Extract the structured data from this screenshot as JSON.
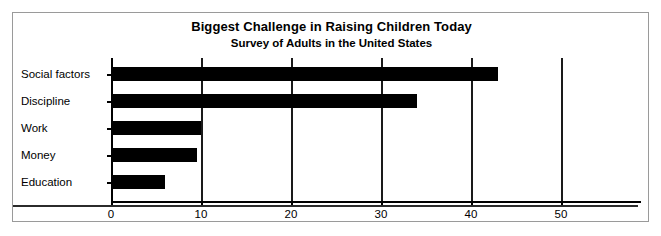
{
  "chart_data": {
    "type": "bar",
    "orientation": "horizontal",
    "title": "Biggest Challenge in Raising Children Today",
    "subtitle": "Survey of Adults in the United States",
    "xlabel": "",
    "ylabel": "",
    "categories": [
      "Social factors",
      "Discipline",
      "Work",
      "Money",
      "Education"
    ],
    "values": [
      43,
      34,
      10,
      9.5,
      6
    ],
    "xlim": [
      0,
      59
    ],
    "xticks": [
      0,
      10,
      20,
      30,
      40,
      50
    ],
    "xticklabels": [
      "0",
      "10",
      "20",
      "30",
      "40",
      "50"
    ],
    "grid": "vertical",
    "legend": "none",
    "bar_color": "#000000",
    "background_color": "#ffffff",
    "border_color": "#9a9a9a"
  },
  "axis": {
    "ticks": [
      {
        "label": "0",
        "value": 0
      },
      {
        "label": "10",
        "value": 10
      },
      {
        "label": "20",
        "value": 20
      },
      {
        "label": "30",
        "value": 30
      },
      {
        "label": "40",
        "value": 40
      },
      {
        "label": "50",
        "value": 50
      }
    ]
  },
  "bars": [
    {
      "label": "Social factors",
      "value": 43
    },
    {
      "label": "Discipline",
      "value": 34
    },
    {
      "label": "Work",
      "value": 10
    },
    {
      "label": "Money",
      "value": 9.5
    },
    {
      "label": "Education",
      "value": 6
    }
  ]
}
